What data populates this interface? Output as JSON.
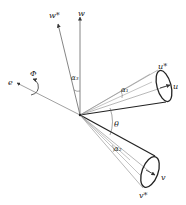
{
  "diagram": {
    "type": "vector-geometry",
    "axes": {
      "w": {
        "label": "w"
      },
      "w_star": {
        "label": "w*"
      },
      "e": {
        "label": "e"
      },
      "u": {
        "label": "u"
      },
      "u_star": {
        "label": "u*"
      },
      "v": {
        "label": "v"
      },
      "v_star": {
        "label": "v*"
      }
    },
    "angles": {
      "alpha1": {
        "label": "α₁"
      },
      "alpha2": {
        "label": "α₂"
      },
      "alpha3": {
        "label": "α₃"
      },
      "theta": {
        "label": "θ"
      },
      "phi": {
        "label": "Φ"
      }
    },
    "colors": {
      "line": "#555555",
      "cone_edge": "#222222",
      "text": "#222222"
    }
  }
}
